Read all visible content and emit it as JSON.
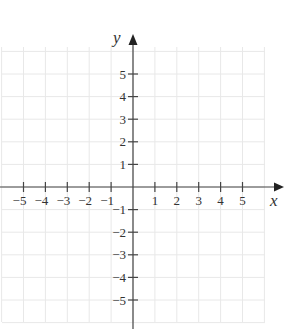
{
  "diagram": {
    "type": "coordinate-plane",
    "x_axis": {
      "label": "x",
      "ticks": [
        "-5",
        "-4",
        "-3",
        "-2",
        "-1",
        "1",
        "2",
        "3",
        "4",
        "5"
      ]
    },
    "y_axis": {
      "label": "y",
      "ticks": [
        "5",
        "4",
        "3",
        "2",
        "1",
        "-1",
        "-2",
        "-3",
        "-4",
        "-5"
      ]
    },
    "grid": true,
    "colors": {
      "axis": "#444444",
      "grid": "#e8e8e8",
      "text": "#333333"
    }
  },
  "chart_data": {
    "type": "scatter",
    "title": "",
    "xlabel": "x",
    "ylabel": "y",
    "xlim": [
      -6,
      6
    ],
    "ylim": [
      -6,
      6
    ],
    "x_ticks": [
      -5,
      -4,
      -3,
      -2,
      -1,
      1,
      2,
      3,
      4,
      5
    ],
    "y_ticks": [
      -5,
      -4,
      -3,
      -2,
      -1,
      1,
      2,
      3,
      4,
      5
    ],
    "grid": true,
    "series": []
  }
}
